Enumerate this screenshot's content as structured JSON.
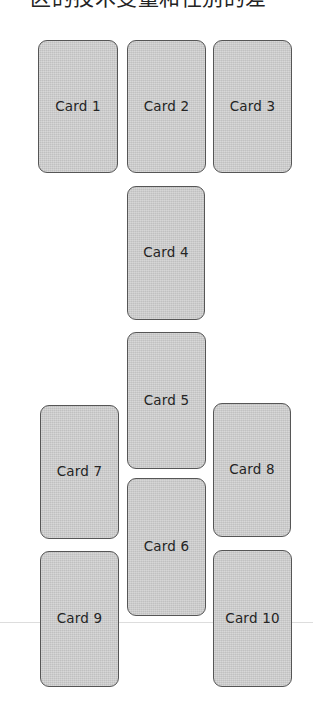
{
  "page": {
    "background_color": "#ffffff",
    "width": 313,
    "height": 722
  },
  "heading": {
    "text": "区的技术变量和性别的差",
    "note_visible": "partially clipped at top edge"
  },
  "divider": {
    "name": "hairline-rule",
    "color": "#dddddd",
    "y": 622
  },
  "style": {
    "card_fill": "#c9c9c9",
    "card_border": "#565656",
    "label_color": "#242424"
  },
  "cards": [
    {
      "label": "Card 1",
      "x": 38,
      "y": 40,
      "w": 80,
      "h": 133
    },
    {
      "label": "Card 2",
      "x": 127,
      "y": 40,
      "w": 79,
      "h": 133
    },
    {
      "label": "Card 3",
      "x": 213,
      "y": 40,
      "w": 79,
      "h": 133
    },
    {
      "label": "Card 4",
      "x": 127,
      "y": 186,
      "w": 78,
      "h": 134
    },
    {
      "label": "Card 5",
      "x": 127,
      "y": 332,
      "w": 79,
      "h": 137
    },
    {
      "label": "Card 6",
      "x": 127,
      "y": 478,
      "w": 79,
      "h": 138
    },
    {
      "label": "Card 7",
      "x": 40,
      "y": 405,
      "w": 79,
      "h": 134
    },
    {
      "label": "Card 8",
      "x": 213,
      "y": 403,
      "w": 78,
      "h": 134
    },
    {
      "label": "Card 9",
      "x": 40,
      "y": 551,
      "w": 79,
      "h": 136
    },
    {
      "label": "Card 10",
      "x": 213,
      "y": 550,
      "w": 79,
      "h": 137
    }
  ]
}
